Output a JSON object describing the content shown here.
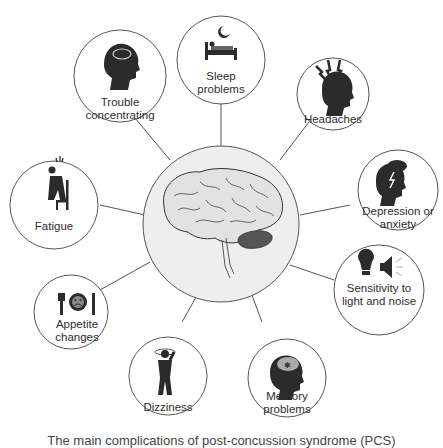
{
  "diagram": {
    "center": {
      "label": "Brain",
      "icon": "brain-icon",
      "fill": "#eeeeee",
      "stroke": "#555555"
    },
    "symptoms": [
      {
        "id": "sleep-problems",
        "label_lines": [
          "Sleep",
          "problems"
        ],
        "icon": "bed-moon-icon"
      },
      {
        "id": "headaches",
        "label_lines": [
          "Headaches"
        ],
        "icon": "head-lightning-icon"
      },
      {
        "id": "depression-anxiety",
        "label_lines": [
          "Depression or",
          "anxiety"
        ],
        "icon": "head-storm-cloud-icon"
      },
      {
        "id": "sensitivity-light-noise",
        "label_lines": [
          "Sensitivity to",
          "light and noise"
        ],
        "icon": "lightbulb-speaker-icon"
      },
      {
        "id": "memory-problems",
        "label_lines": [
          "Memory",
          "problems"
        ],
        "icon": "head-puzzle-icon"
      },
      {
        "id": "dizziness",
        "label_lines": [
          "Dizziness"
        ],
        "icon": "dizzy-person-icon"
      },
      {
        "id": "appetite-changes",
        "label_lines": [
          "Appetite",
          "changes"
        ],
        "icon": "sad-plate-icon"
      },
      {
        "id": "fatigue",
        "label_lines": [
          "Fatigue"
        ],
        "icon": "tired-person-chair-icon"
      },
      {
        "id": "trouble-concentrating",
        "label_lines": [
          "Trouble",
          "concentrating"
        ],
        "icon": "head-brain-icon"
      }
    ],
    "caption": "The main complications of post-concussion syndrome (PCS)",
    "colors": {
      "line": "#555555",
      "icon": "#2b2b2b",
      "text": "#2e2e2e",
      "cerebellum": "#555555"
    }
  }
}
